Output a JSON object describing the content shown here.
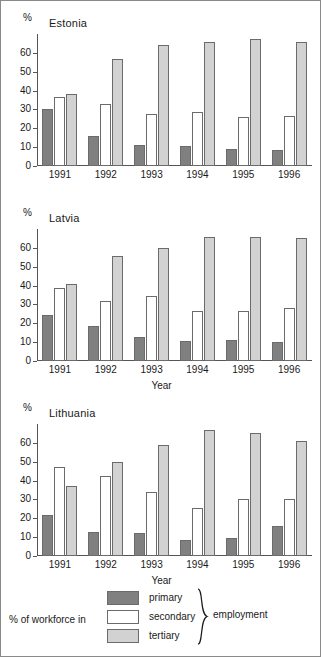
{
  "figure": {
    "y_axis_unit": "%",
    "x_axis_title": "Year",
    "categories": [
      "1991",
      "1992",
      "1993",
      "1994",
      "1995",
      "1996"
    ],
    "y_ticks": [
      "0",
      "10",
      "20",
      "30",
      "40",
      "50",
      "60"
    ],
    "y_min": 0,
    "y_max": 70,
    "colors": {
      "primary": "#808080",
      "secondary": "#ffffff",
      "tertiary": "#d2d2d2",
      "outline": "#6b6b6b",
      "axis": "#555555"
    }
  },
  "legend": {
    "caption": "% of workforce in",
    "suffix": "employment",
    "items": [
      {
        "label": "primary",
        "key": "primary"
      },
      {
        "label": "secondary",
        "key": "secondary"
      },
      {
        "label": "tertiary",
        "key": "tertiary"
      }
    ]
  },
  "panels": [
    {
      "title": "Estonia",
      "unit": "%",
      "x_axis_title": ""
    },
    {
      "title": "Latvia",
      "unit": "%",
      "x_axis_title": "Year"
    },
    {
      "title": "Lithuania",
      "unit": "%",
      "x_axis_title": "Year"
    }
  ],
  "chart_data": [
    {
      "type": "bar",
      "title": "Estonia",
      "xlabel": "",
      "ylabel": "%",
      "ylim": [
        0,
        70
      ],
      "yticks": [
        0,
        10,
        20,
        30,
        40,
        50,
        60
      ],
      "grid": false,
      "legend_position": "figure-bottom",
      "categories": [
        "1991",
        "1992",
        "1993",
        "1994",
        "1995",
        "1996"
      ],
      "series": [
        {
          "name": "primary",
          "values": [
            30.5,
            16.0,
            11.0,
            10.5,
            9.0,
            8.5
          ]
        },
        {
          "name": "secondary",
          "values": [
            36.5,
            33.0,
            27.5,
            28.5,
            26.0,
            26.5
          ]
        },
        {
          "name": "tertiary",
          "values": [
            38.0,
            56.5,
            64.0,
            66.0,
            67.5,
            66.0
          ]
        }
      ]
    },
    {
      "type": "bar",
      "title": "Latvia",
      "xlabel": "Year",
      "ylabel": "%",
      "ylim": [
        0,
        70
      ],
      "yticks": [
        0,
        10,
        20,
        30,
        40,
        50,
        60
      ],
      "grid": false,
      "legend_position": "figure-bottom",
      "categories": [
        "1991",
        "1992",
        "1993",
        "1994",
        "1995",
        "1996"
      ],
      "series": [
        {
          "name": "primary",
          "values": [
            24.5,
            18.5,
            13.0,
            10.5,
            11.0,
            10.0
          ]
        },
        {
          "name": "secondary",
          "values": [
            38.5,
            32.0,
            34.5,
            26.5,
            26.5,
            28.0
          ]
        },
        {
          "name": "tertiary",
          "values": [
            41.0,
            55.5,
            60.0,
            66.0,
            66.0,
            65.5
          ]
        }
      ]
    },
    {
      "type": "bar",
      "title": "Lithuania",
      "xlabel": "Year",
      "ylabel": "%",
      "ylim": [
        0,
        70
      ],
      "yticks": [
        0,
        10,
        20,
        30,
        40,
        50,
        60
      ],
      "grid": false,
      "legend_position": "figure-bottom",
      "categories": [
        "1991",
        "1992",
        "1993",
        "1994",
        "1995",
        "1996"
      ],
      "series": [
        {
          "name": "primary",
          "values": [
            21.5,
            12.5,
            12.0,
            8.5,
            9.5,
            16.0
          ]
        },
        {
          "name": "secondary",
          "values": [
            47.0,
            42.5,
            34.0,
            25.5,
            30.5,
            30.5
          ]
        },
        {
          "name": "tertiary",
          "values": [
            37.0,
            50.0,
            59.0,
            67.0,
            65.0,
            61.0
          ]
        }
      ]
    }
  ]
}
